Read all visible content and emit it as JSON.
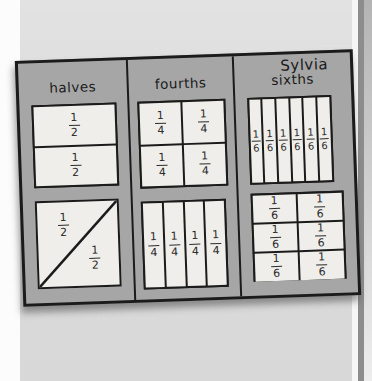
{
  "student_name": "Sylvia",
  "board": {
    "columns": [
      {
        "label": "halves",
        "shapes": [
          {
            "kind": "grid",
            "rows": 2,
            "cols": 1,
            "cells": [
              "1/2",
              "1/2"
            ]
          },
          {
            "kind": "diagonal",
            "cells": [
              "1/2",
              "1/2"
            ]
          }
        ]
      },
      {
        "label": "fourths",
        "shapes": [
          {
            "kind": "grid",
            "rows": 2,
            "cols": 2,
            "cells": [
              "1/4",
              "1/4",
              "1/4",
              "1/4"
            ]
          },
          {
            "kind": "grid",
            "rows": 1,
            "cols": 4,
            "cells": [
              "1/4",
              "1/4",
              "1/4",
              "1/4"
            ]
          }
        ]
      },
      {
        "label": "sixths",
        "shapes": [
          {
            "kind": "grid",
            "rows": 1,
            "cols": 6,
            "cells": [
              "1/6",
              "1/6",
              "1/6",
              "1/6",
              "1/6",
              "1/6"
            ]
          },
          {
            "kind": "grid",
            "rows": 3,
            "cols": 2,
            "cells": [
              "1/6",
              "1/6",
              "1/6",
              "1/6",
              "1/6",
              "1/6"
            ]
          }
        ]
      }
    ]
  },
  "colors": {
    "paper": "#dedede",
    "board": "#a6a6a6",
    "cell": "#efeeea",
    "line": "#1b1b1b",
    "page_edge_band": "#8d8d8d"
  }
}
